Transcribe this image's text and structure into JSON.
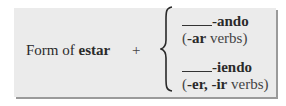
{
  "formula": {
    "left_prefix": "Form of ",
    "left_verb": "estar",
    "operator": "+",
    "options": [
      {
        "ending": "-ando",
        "note_open": "(",
        "note_bold": "-ar",
        "note_rest": " verbs)"
      },
      {
        "ending": "-iendo",
        "note_open": "(",
        "note_bold": "-er, -ir",
        "note_rest": " verbs)"
      }
    ]
  }
}
